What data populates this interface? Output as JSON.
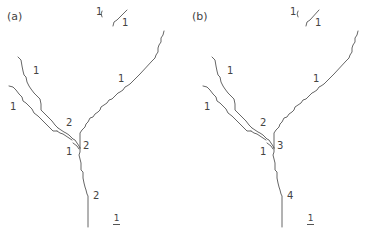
{
  "figure": {
    "panels": [
      {
        "id": "a",
        "label": "(a)",
        "order_labels": {
          "top_fragment_left": "1",
          "top_fragment_right": "1",
          "upper_left_tributary": "1",
          "left_tributary": "1",
          "right_tributary": "1",
          "merged_left": "2",
          "junction_small_tributary": "1",
          "junction_main": "2",
          "trunk": "2"
        },
        "scale_label": "1"
      },
      {
        "id": "b",
        "label": "(b)",
        "order_labels": {
          "top_fragment_left": "1",
          "top_fragment_right": "1",
          "upper_left_tributary": "1",
          "left_tributary": "1",
          "right_tributary": "1",
          "merged_left": "2",
          "junction_small_tributary": "1",
          "junction_main": "3",
          "trunk": "4"
        },
        "scale_label": "1"
      }
    ],
    "line_color": "#555555",
    "text_color": "#444444"
  }
}
